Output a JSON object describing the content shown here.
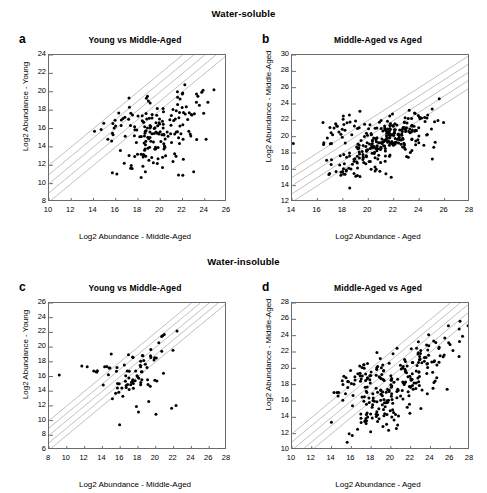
{
  "figure": {
    "groups": [
      {
        "id": "soluble",
        "label": "Water-soluble"
      },
      {
        "id": "insoluble",
        "label": "Water-insoluble"
      }
    ]
  },
  "chart_data": [
    {
      "id": "a",
      "type": "scatter",
      "panel_letter": "a",
      "group": "Water-soluble",
      "title": "Young vs Middle-Aged",
      "xlabel": "Log2 Abundance - Middle-Aged",
      "ylabel": "Log2 Abundance - Young",
      "xlim": [
        10,
        26
      ],
      "ylim": [
        8,
        24
      ],
      "xticks": [
        10,
        12,
        14,
        16,
        18,
        20,
        22,
        24,
        26
      ],
      "yticks": [
        8,
        10,
        12,
        14,
        16,
        18,
        20,
        22,
        24
      ],
      "grid": false,
      "legend": "none",
      "marker_color": "#000000",
      "reference_line_color": "#b0b0b0",
      "reference_lines": [
        {
          "label": "+4x",
          "offset": 2
        },
        {
          "label": "+2x",
          "offset": 1
        },
        {
          "label": "1x",
          "offset": 0
        },
        {
          "label": "-2x",
          "offset": -1
        },
        {
          "label": "-4x",
          "offset": -2
        }
      ],
      "n_points": 186,
      "generator": {
        "seed": 1741,
        "clusters": [
          {
            "n": 132,
            "mx": 19.9,
            "my": 15.2,
            "sx": 1.85,
            "sy": 1.85,
            "rho": 0.42
          },
          {
            "n": 30,
            "mx": 17.0,
            "my": 16.9,
            "sx": 1.6,
            "sy": 1.3,
            "rho": 0.55
          },
          {
            "n": 16,
            "mx": 22.7,
            "my": 19.3,
            "sx": 1.15,
            "sy": 1.25,
            "rho": 0.35
          },
          {
            "n": 8,
            "mx": 20.0,
            "my": 11.6,
            "sx": 1.6,
            "sy": 0.6,
            "rho": 0.1
          }
        ]
      }
    },
    {
      "id": "b",
      "type": "scatter",
      "panel_letter": "b",
      "group": "Water-soluble",
      "title": "Middle-Aged vs Aged",
      "xlabel": "Log2 Abundance - Aged",
      "ylabel": "Log2 Abundance - Middle-Aged",
      "xlim": [
        14,
        28
      ],
      "ylim": [
        12,
        30
      ],
      "xticks": [
        14,
        16,
        18,
        20,
        22,
        24,
        26,
        28
      ],
      "yticks": [
        12,
        14,
        16,
        18,
        20,
        22,
        24,
        26,
        28,
        30
      ],
      "grid": false,
      "legend": "none",
      "marker_color": "#000000",
      "reference_line_color": "#b0b0b0",
      "reference_lines": [
        {
          "label": "+4x",
          "offset": 2
        },
        {
          "label": "+2x",
          "offset": 1
        },
        {
          "label": "1x",
          "offset": 0
        },
        {
          "label": "-2x",
          "offset": -1
        },
        {
          "label": "-4x",
          "offset": -2
        }
      ],
      "n_points": 298,
      "generator": {
        "seed": 2286,
        "clusters": [
          {
            "n": 168,
            "mx": 21.4,
            "my": 19.7,
            "sx": 1.25,
            "sy": 1.3,
            "rho": 0.62
          },
          {
            "n": 56,
            "mx": 19.3,
            "my": 16.4,
            "sx": 1.5,
            "sy": 1.15,
            "rho": 0.4
          },
          {
            "n": 44,
            "mx": 18.6,
            "my": 20.8,
            "sx": 1.5,
            "sy": 1.1,
            "rho": 0.35
          },
          {
            "n": 30,
            "mx": 24.4,
            "my": 20.6,
            "sx": 1.3,
            "sy": 2.0,
            "rho": 0.3
          }
        ]
      }
    },
    {
      "id": "c",
      "type": "scatter",
      "panel_letter": "c",
      "group": "Water-insoluble",
      "title": "Young vs Middle-Aged",
      "xlabel": "Log2 Abundance - Middle-Aged",
      "ylabel": "Log2 Abundance - Young",
      "xlim": [
        8,
        28
      ],
      "ylim": [
        6,
        26
      ],
      "xticks": [
        8,
        10,
        12,
        14,
        16,
        18,
        20,
        22,
        24,
        26,
        28
      ],
      "yticks": [
        6,
        8,
        10,
        12,
        14,
        16,
        18,
        20,
        22,
        24,
        26
      ],
      "grid": false,
      "legend": "none",
      "marker_color": "#000000",
      "reference_line_color": "#b0b0b0",
      "reference_lines": [
        {
          "label": "+4x",
          "offset": 2
        },
        {
          "label": "+2x",
          "offset": 1
        },
        {
          "label": "1x",
          "offset": 0
        },
        {
          "label": "-2x",
          "offset": -1
        },
        {
          "label": "-4x",
          "offset": -2
        }
      ],
      "n_points": 88,
      "generator": {
        "seed": 907,
        "clusters": [
          {
            "n": 44,
            "mx": 17.6,
            "my": 15.4,
            "sx": 1.5,
            "sy": 1.5,
            "rho": 0.62
          },
          {
            "n": 24,
            "mx": 15.2,
            "my": 17.2,
            "sx": 1.9,
            "sy": 1.0,
            "rho": 0.3
          },
          {
            "n": 12,
            "mx": 19.6,
            "my": 19.5,
            "sx": 1.2,
            "sy": 1.3,
            "rho": 0.45
          },
          {
            "n": 8,
            "mx": 21.6,
            "my": 12.3,
            "sx": 2.6,
            "sy": 1.6,
            "rho": 0.2
          }
        ]
      }
    },
    {
      "id": "d",
      "type": "scatter",
      "panel_letter": "d",
      "group": "Water-insoluble",
      "title": "Middle-Aged vs Aged",
      "xlabel": "Log2 Abundance - Aged",
      "ylabel": "Log2 Abundance - Middle-Aged",
      "xlim": [
        10,
        28
      ],
      "ylim": [
        10,
        28
      ],
      "xticks": [
        10,
        12,
        14,
        16,
        18,
        20,
        22,
        24,
        26,
        28
      ],
      "yticks": [
        10,
        12,
        14,
        16,
        18,
        20,
        22,
        24,
        26,
        28
      ],
      "grid": false,
      "legend": "none",
      "marker_color": "#000000",
      "reference_line_color": "#b0b0b0",
      "reference_lines": [
        {
          "label": "+4x",
          "offset": 2
        },
        {
          "label": "+2x",
          "offset": 1
        },
        {
          "label": "1x",
          "offset": 0
        },
        {
          "label": "-2x",
          "offset": -1
        },
        {
          "label": "-4x",
          "offset": -2
        }
      ],
      "n_points": 262,
      "generator": {
        "seed": 5513,
        "clusters": [
          {
            "n": 128,
            "mx": 20.6,
            "my": 17.6,
            "sx": 2.2,
            "sy": 2.3,
            "rho": 0.72
          },
          {
            "n": 58,
            "mx": 17.0,
            "my": 18.6,
            "sx": 1.7,
            "sy": 1.3,
            "rho": 0.5
          },
          {
            "n": 50,
            "mx": 23.8,
            "my": 21.6,
            "sx": 1.5,
            "sy": 1.7,
            "rho": 0.55
          },
          {
            "n": 26,
            "mx": 18.4,
            "my": 13.6,
            "sx": 1.8,
            "sy": 1.2,
            "rho": 0.3
          }
        ]
      }
    }
  ]
}
